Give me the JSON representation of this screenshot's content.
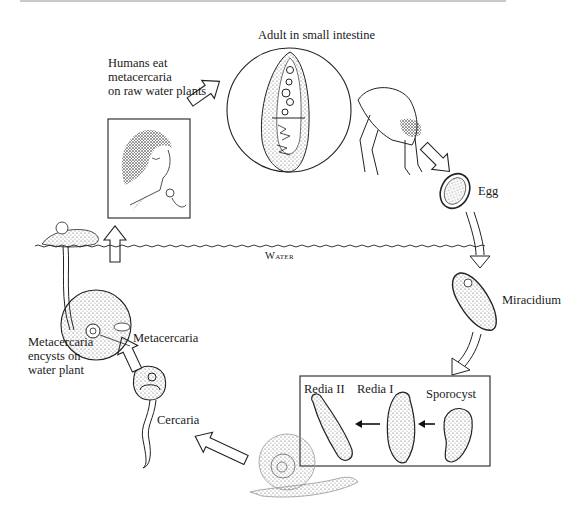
{
  "diagram": {
    "stages": {
      "adult": {
        "label": "Adult in small intestine"
      },
      "humans_eat": {
        "label_lines": [
          "Humans eat",
          "metacercaria",
          "on raw water plants"
        ]
      },
      "egg": {
        "label": "Egg"
      },
      "water": {
        "label": "Water"
      },
      "miracidium": {
        "label": "Miracidium"
      },
      "snail_stages": {
        "redia2": {
          "label": "Redia II"
        },
        "redia1": {
          "label": "Redia I"
        },
        "sporocyst": {
          "label": "Sporocyst"
        }
      },
      "cercaria": {
        "label": "Cercaria"
      },
      "metacercaria": {
        "label": "Metacercaria"
      },
      "encysts": {
        "label_lines": [
          "Metacercaria",
          "encysts on",
          "water plant"
        ]
      }
    },
    "colors": {
      "ink": "#1a1a1a",
      "background": "#ffffff",
      "stipple": "#555555",
      "top_rule": "#c9c9c9"
    }
  }
}
